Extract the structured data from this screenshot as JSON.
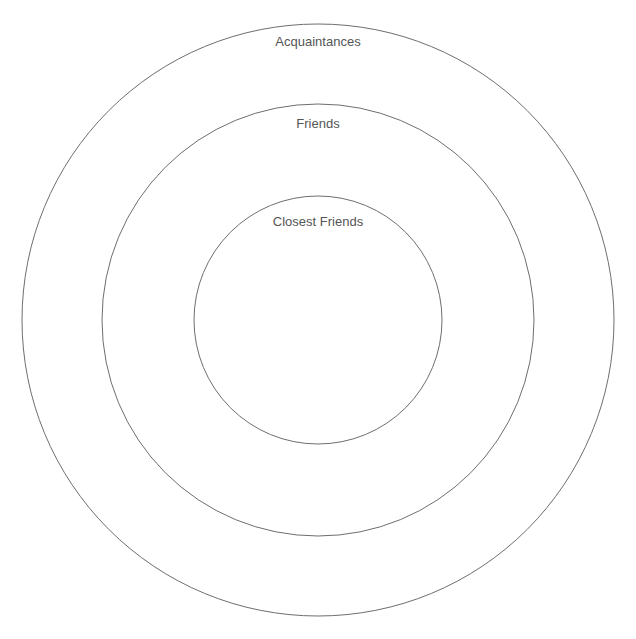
{
  "diagram": {
    "type": "concentric-circles",
    "center": {
      "x": 318,
      "y": 320
    },
    "rings": [
      {
        "label": "Acquaintances",
        "radius": 296,
        "label_y": 46
      },
      {
        "label": "Friends",
        "radius": 216,
        "label_y": 128
      },
      {
        "label": "Closest Friends",
        "radius": 124,
        "label_y": 226
      }
    ],
    "colors": {
      "stroke": "#6e6e6e",
      "text": "#555555",
      "background": "#ffffff"
    }
  }
}
